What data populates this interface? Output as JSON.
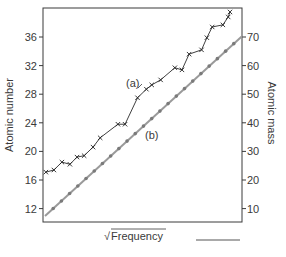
{
  "chart_data": {
    "type": "line",
    "title": "",
    "xlabel": "√Frequency",
    "ylabel": "Atomic number",
    "y2label": "Atomic mass",
    "ylim": [
      10.5,
      40.5
    ],
    "y2lim": [
      5,
      80
    ],
    "yticks": [
      12,
      16,
      20,
      24,
      28,
      32,
      36
    ],
    "y2ticks": [
      10,
      20,
      30,
      40,
      50,
      60,
      70
    ],
    "grid": false,
    "legend": null,
    "annotations": [
      {
        "text": "(a)",
        "series": "a"
      },
      {
        "text": "(b)",
        "series": "b"
      }
    ],
    "series": [
      {
        "name": "(a)",
        "axis": "left",
        "marker": "x",
        "color": "#2a2a2a",
        "x": [
          0.5,
          5,
          9.5,
          14,
          18,
          22,
          27,
          31,
          41,
          45,
          52,
          57,
          60,
          65,
          73,
          77,
          81,
          88,
          91,
          94,
          100,
          103,
          104
        ],
        "values": [
          17.1,
          17.4,
          18.5,
          18.2,
          19.2,
          19.4,
          20.6,
          21.9,
          23.8,
          23.8,
          27.5,
          28.7,
          29.3,
          30.0,
          31.7,
          31.4,
          33.6,
          34.2,
          35.9,
          37.4,
          37.7,
          38.8,
          39.5
        ]
      },
      {
        "name": "(b)",
        "axis": "right",
        "marker": "dot",
        "color": "#9a9a9a",
        "x": [
          0,
          110
        ],
        "values": [
          7.4,
          70.3
        ]
      }
    ]
  },
  "axes": {
    "left_ticks": [
      "12",
      "16",
      "20",
      "24",
      "28",
      "32",
      "36"
    ],
    "right_ticks": [
      "10",
      "20",
      "30",
      "40",
      "50",
      "60",
      "70"
    ],
    "left_title": "Atomic number",
    "right_title": "Atomic mass",
    "x_title_radical": "√",
    "x_title": "Frequency"
  },
  "labels": {
    "a": "(a)",
    "b": "(b)"
  }
}
